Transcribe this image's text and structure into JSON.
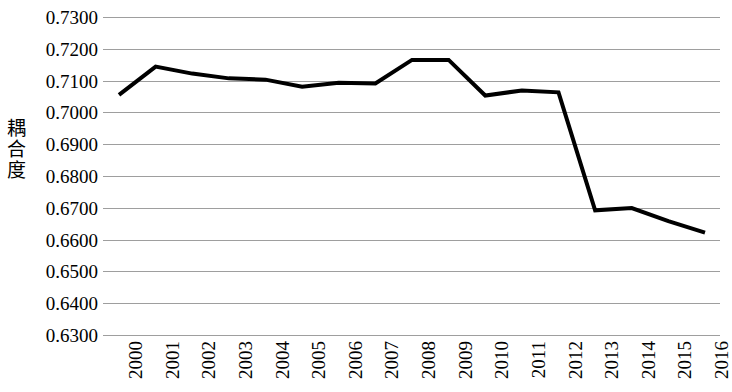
{
  "chart_data": {
    "type": "line",
    "title": "",
    "subtitle": "",
    "xlabel": "",
    "ylabel": "耦合度",
    "categories": [
      "2000",
      "2001",
      "2002",
      "2003",
      "2004",
      "2005",
      "2006",
      "2007",
      "2008",
      "2009",
      "2010",
      "2011",
      "2012",
      "2013",
      "2014",
      "2015",
      "2016"
    ],
    "values": [
      0.7055,
      0.7144,
      0.7122,
      0.7107,
      0.7103,
      0.7081,
      0.7093,
      0.7091,
      0.7165,
      0.7165,
      0.7053,
      0.7069,
      0.7063,
      0.6692,
      0.6699,
      0.6658,
      0.6622
    ],
    "series": [
      {
        "name": "耦合度",
        "values": [
          0.7055,
          0.7144,
          0.7122,
          0.7107,
          0.7103,
          0.7081,
          0.7093,
          0.7091,
          0.7165,
          0.7165,
          0.7053,
          0.7069,
          0.7063,
          0.6692,
          0.6699,
          0.6658,
          0.6622
        ]
      }
    ],
    "ylim": [
      0.63,
      0.73
    ],
    "ytick_step": 0.01,
    "ytick_labels": [
      "0.7300",
      "0.7200",
      "0.7100",
      "0.7000",
      "0.6900",
      "0.6800",
      "0.6700",
      "0.6600",
      "0.6500",
      "0.6400",
      "0.6300"
    ],
    "ytick_values": [
      0.73,
      0.72,
      0.71,
      0.7,
      0.69,
      0.68,
      0.67,
      0.66,
      0.65,
      0.64,
      0.63
    ],
    "grid": true,
    "grid_axis": "y",
    "legend": false,
    "legend_position": "none",
    "line_color": "#000000",
    "line_width": 4,
    "grid_color": "#8d8d8d",
    "background_color": "#ffffff",
    "markers": false,
    "annotations": []
  }
}
